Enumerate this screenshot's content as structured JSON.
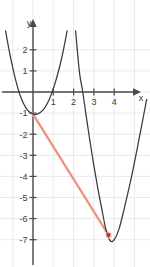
{
  "figure": {
    "title": "",
    "axis_labels": {
      "x": "x",
      "y": "y"
    },
    "colors": {
      "curve": "#3a3a3a",
      "secant": "#e8705a",
      "secant_halo": "#f6c3b6",
      "point": "#c0392b",
      "grid": "#e9e9ef",
      "axis": "#4a4a4a",
      "background": "#ffffff",
      "text": "#3b3b3b"
    }
  },
  "chart_data": {
    "type": "line",
    "title": "",
    "xlabel": "x",
    "ylabel": "y",
    "grid": true,
    "legend": "none",
    "xlim": [
      -1.7,
      5.8
    ],
    "ylim": [
      -7.6,
      2.9
    ],
    "xticks": [
      1,
      2,
      3,
      4
    ],
    "xtick_labels": [
      "1",
      "2",
      "3",
      "4"
    ],
    "yticks": [
      2,
      1,
      -1,
      -2,
      -3,
      -4,
      -5,
      -6,
      -7
    ],
    "ytick_labels": [
      "2",
      "1",
      "-1",
      "-2",
      "-3",
      "-4",
      "-5",
      "-6",
      "-7"
    ],
    "series": [
      {
        "name": "parabola-left",
        "type": "curve",
        "vertex": [
          0.2,
          -1.05
        ],
        "points": [
          [
            -1.35,
            2.9
          ],
          [
            -1.1,
            1.6
          ],
          [
            -0.85,
            0.55
          ],
          [
            -0.6,
            -0.25
          ],
          [
            -0.35,
            -0.75
          ],
          [
            -0.1,
            -1.0
          ],
          [
            0.2,
            -1.05
          ],
          [
            0.5,
            -0.85
          ],
          [
            0.8,
            -0.35
          ],
          [
            1.05,
            0.3
          ],
          [
            1.3,
            1.15
          ],
          [
            1.5,
            2.0
          ],
          [
            1.68,
            2.9
          ]
        ]
      },
      {
        "name": "parabola-right",
        "type": "curve",
        "vertex": [
          3.8,
          -7.05
        ],
        "roots_visible": [
          2.45
        ],
        "points": [
          [
            2.1,
            2.9
          ],
          [
            2.2,
            1.8
          ],
          [
            2.3,
            0.85
          ],
          [
            2.45,
            0.0
          ],
          [
            2.6,
            -1.0
          ],
          [
            2.8,
            -2.3
          ],
          [
            3.0,
            -3.5
          ],
          [
            3.2,
            -4.6
          ],
          [
            3.4,
            -5.6
          ],
          [
            3.6,
            -6.55
          ],
          [
            3.8,
            -7.05
          ],
          [
            4.0,
            -7.0
          ],
          [
            4.25,
            -6.45
          ],
          [
            4.5,
            -5.5
          ],
          [
            4.8,
            -4.25
          ],
          [
            5.1,
            -2.85
          ],
          [
            5.35,
            -1.6
          ],
          [
            5.6,
            -0.35
          ]
        ]
      },
      {
        "name": "secant-line",
        "type": "line",
        "from": [
          0,
          -1.05
        ],
        "to": [
          3.72,
          -6.78
        ],
        "color": "#e8705a"
      }
    ],
    "markers": [
      {
        "name": "tangency-point",
        "x": 3.72,
        "y": -6.78,
        "color": "#c0392b",
        "shape": "dot"
      }
    ]
  }
}
